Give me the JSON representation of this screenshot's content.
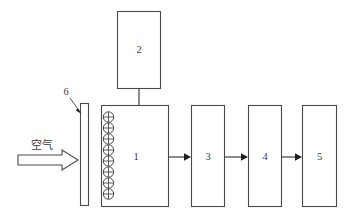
{
  "diagram": {
    "type": "process-flow-schematic",
    "background_color": "#ffffff",
    "line_color": "#4a4a4a",
    "arrow_fill": "#1f1f1f"
  },
  "inlet": {
    "stream_label": "空气",
    "arrow_style": "hollow-block-arrow",
    "direction": "right"
  },
  "components": {
    "filter_bar": {
      "ref": "6",
      "shape": "thin-vertical-bar"
    },
    "reactor": {
      "ref": "1",
      "shape": "rectangle",
      "coil_count": 8,
      "coil_symbol": "circle-with-cross"
    },
    "vessel_top": {
      "ref": "2",
      "shape": "rectangle"
    },
    "unit_three": {
      "ref": "3",
      "shape": "rectangle"
    },
    "unit_four": {
      "ref": "4",
      "shape": "rectangle"
    },
    "unit_five": {
      "ref": "5",
      "shape": "rectangle"
    }
  },
  "connectors": {
    "vessel_to_reactor": "vertical-line",
    "reactor_to_three": "arrow-right",
    "three_to_four": "arrow-right",
    "four_to_five": "arrow-right",
    "six_leader": "diagonal-arrow-leader"
  }
}
